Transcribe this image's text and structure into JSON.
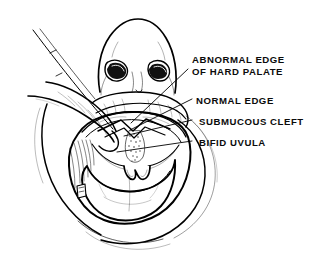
{
  "figure": {
    "background_color": "#ffffff",
    "ink_color": "#000000",
    "width": 321,
    "height": 261
  },
  "labels": [
    {
      "id": "abnormal-edge-of-hard-palate",
      "line1": "ABNORMAL EDGE",
      "line2": "OF HARD PALATE",
      "leader_from": [
        188,
        70
      ],
      "leader_to": [
        131,
        123
      ]
    },
    {
      "id": "normal-edge",
      "line1": "NORMAL EDGE",
      "line2": "",
      "leader_from": [
        192,
        99
      ],
      "leader_to": [
        130,
        130
      ]
    },
    {
      "id": "submucous-cleft",
      "line1": "SUBMUCOUS CLEFT",
      "line2": "",
      "leader_from": [
        192,
        120
      ],
      "leader_to": [
        124,
        135
      ]
    },
    {
      "id": "bifid-uvula",
      "line1": "BIFID UVULA",
      "line2": "",
      "leader_from": [
        192,
        141
      ],
      "leader_to": [
        118,
        152
      ]
    }
  ],
  "anatomy_parts": [
    "nose",
    "left-nostril",
    "right-nostril",
    "upper-lip",
    "lower-lip",
    "tongue",
    "hard-palate",
    "soft-palate",
    "bifid-uvula",
    "submucous-cleft",
    "retracting-finger",
    "chin"
  ]
}
